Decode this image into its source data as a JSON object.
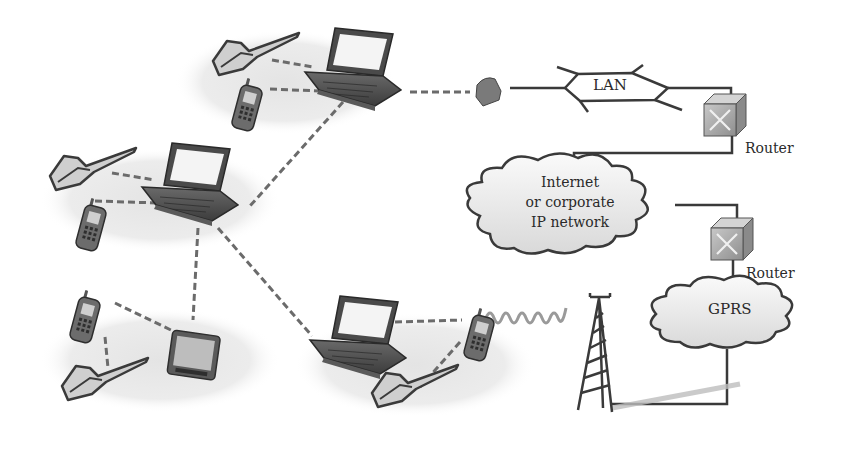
{
  "diagram": {
    "colors": {
      "background": "#ffffff",
      "ellipse_fill": "#ebebeb",
      "line": "#3a3a3a",
      "dashed_link": "#6b6b6b",
      "device_dark": "#4a4a4a",
      "screen": "#f4f4f4",
      "router_fill": "#a9a9a9",
      "cloud_fill": "#f2f2f2",
      "radio_wave": "#9a9a9a"
    },
    "labels": {
      "lan": "LAN",
      "router_top": "Router",
      "router_bottom": "Router",
      "cloud_line1": "Internet",
      "cloud_line2": "or corporate",
      "cloud_line3": "IP network",
      "gprs": "GPRS"
    },
    "nodes": [
      {
        "id": "pan-top",
        "type": "piconet",
        "devices": [
          "laptop",
          "pen-phone",
          "mobile-phone"
        ]
      },
      {
        "id": "pan-middle",
        "type": "piconet",
        "devices": [
          "laptop",
          "pen-phone",
          "mobile-phone"
        ]
      },
      {
        "id": "pan-bottom-left",
        "type": "piconet",
        "devices": [
          "pda",
          "mobile-phone",
          "pen-phone"
        ]
      },
      {
        "id": "pan-bottom-center",
        "type": "piconet",
        "devices": [
          "laptop",
          "mobile-phone",
          "pen-phone"
        ]
      },
      {
        "id": "lan-access-point",
        "type": "access-point"
      },
      {
        "id": "lan",
        "type": "lan"
      },
      {
        "id": "router-top",
        "type": "router"
      },
      {
        "id": "ip-network",
        "type": "cloud"
      },
      {
        "id": "router-bottom",
        "type": "router"
      },
      {
        "id": "gprs",
        "type": "cloud"
      },
      {
        "id": "base-station",
        "type": "antenna-tower"
      }
    ]
  }
}
